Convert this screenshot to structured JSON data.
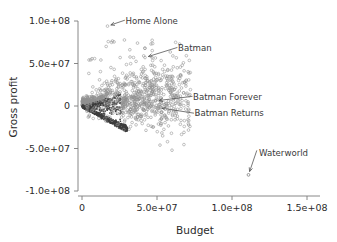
{
  "figure": {
    "background": "#ffffff",
    "point_color": "#909090",
    "dense_color": "#3d3d3d",
    "axis_color": "#7a7a7a",
    "text_color": "#2b2b2b"
  },
  "chart_data": {
    "type": "scatter",
    "title": "",
    "xlabel": "Budget",
    "ylabel": "Gross profit",
    "xlim": [
      -6000000,
      165000000
    ],
    "ylim": [
      -112000000,
      108000000
    ],
    "grid": false,
    "legend": "none",
    "xticks": [
      0,
      50000000,
      100000000,
      150000000
    ],
    "xtick_labels": [
      "0",
      "5.0e+07",
      "1.0e+08",
      "1.5e+08"
    ],
    "yticks": [
      -100000000,
      -50000000,
      0,
      50000000,
      100000000
    ],
    "ytick_labels": [
      "-1.0e+08",
      "-5.0e+07",
      "0",
      "5.0e+07",
      "1.0e+08"
    ],
    "annotations": [
      {
        "label": "Home Alone",
        "point_x": 17000000,
        "point_y": 94000000,
        "text_x": 27000000,
        "text_y": 100000000
      },
      {
        "label": "Batman",
        "point_x": 42000000,
        "point_y": 57000000,
        "text_x": 62000000,
        "text_y": 68000000
      },
      {
        "label": "Batman Forever",
        "point_x": 49000000,
        "point_y": 6000000,
        "text_x": 72000000,
        "text_y": 11000000
      },
      {
        "label": "Batman Returns",
        "point_x": 51000000,
        "point_y": -2000000,
        "text_x": 73000000,
        "text_y": -8000000
      },
      {
        "label": "Waterworld",
        "point_x": 111000000,
        "point_y": -81000000,
        "text_x": 116000000,
        "text_y": -55000000
      }
    ],
    "series": [
      {
        "name": "films",
        "description": "Hollywood films: budget versus gross profit; dense wedge near origin with lower diagonal boundary where profit approx equals minus budget.",
        "n_points_approx": 1200,
        "highlighted": [
          {
            "name": "Home Alone",
            "x": 17000000,
            "y": 94000000
          },
          {
            "name": "Batman",
            "x": 42000000,
            "y": 57000000
          },
          {
            "name": "Batman Forever",
            "x": 49000000,
            "y": 6000000
          },
          {
            "name": "Batman Returns",
            "x": 51000000,
            "y": -2000000
          },
          {
            "name": "Waterworld",
            "x": 111000000,
            "y": -81000000
          }
        ]
      }
    ]
  }
}
